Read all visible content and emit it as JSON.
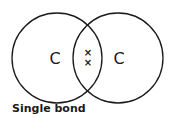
{
  "diagram": {
    "type": "dot-and-cross covalent bond",
    "atoms": [
      {
        "symbol": "C",
        "cx": 57,
        "cy": 58,
        "r": 45
      },
      {
        "symbol": "C",
        "cx": 118,
        "cy": 58,
        "r": 45
      }
    ],
    "shared_electrons": [
      {
        "glyph": "×",
        "x": 88,
        "y": 53
      },
      {
        "glyph": "×",
        "x": 88,
        "y": 63
      }
    ],
    "caption": "Single bond",
    "colors": {
      "stroke": "#1a1a1a",
      "background": "#ffffff"
    }
  }
}
